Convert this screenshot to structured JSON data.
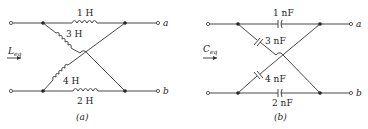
{
  "circuit_a": {
    "caption": "(a)",
    "input_label": "L",
    "input_sub": "eq",
    "terminal_top": "a",
    "terminal_bottom": "b",
    "elements": [
      {
        "name": "top",
        "type": "inductor",
        "value": "1 H"
      },
      {
        "name": "diag-upper",
        "type": "inductor",
        "value": "3 H"
      },
      {
        "name": "diag-lower",
        "type": "inductor",
        "value": "4 H"
      },
      {
        "name": "bottom",
        "type": "inductor",
        "value": "2 H"
      }
    ]
  },
  "circuit_b": {
    "caption": "(b)",
    "input_label": "C",
    "input_sub": "eq",
    "terminal_top": "a",
    "terminal_bottom": "b",
    "elements": [
      {
        "name": "top",
        "type": "capacitor",
        "value": "1 nF"
      },
      {
        "name": "diag-upper",
        "type": "capacitor",
        "value": "3 nF"
      },
      {
        "name": "diag-lower",
        "type": "capacitor",
        "value": "4 nF"
      },
      {
        "name": "bottom",
        "type": "capacitor",
        "value": "2 nF"
      }
    ]
  }
}
